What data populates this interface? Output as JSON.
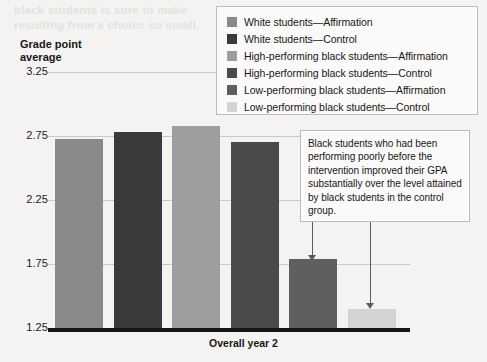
{
  "figure": {
    "background_color": "#f4f3f1",
    "ghost_text": [
      "black students is sure to make",
      "resulting from a choice so small."
    ]
  },
  "axis_title": "Grade point\naverage",
  "x_label": "Overall year 2",
  "legend": {
    "items": [
      {
        "label": "White students—Affirmation",
        "color": "#8a8a8c",
        "swatch_name": "legend-swatch-white-affirmation"
      },
      {
        "label": "White students—Control",
        "color": "#3a3a3d",
        "swatch_name": "legend-swatch-white-control"
      },
      {
        "label": "High-performing black students—Affirmation",
        "color": "#9d9d9f",
        "swatch_name": "legend-swatch-high-affirmation"
      },
      {
        "label": "High-performing black students—Control",
        "color": "#4a4a4d",
        "swatch_name": "legend-swatch-high-control"
      },
      {
        "label": "Low-performing black students—Affirmation",
        "color": "#5f5f62",
        "swatch_name": "legend-swatch-low-affirmation"
      },
      {
        "label": "Low-performing black students—Control",
        "color": "#d3d3d2",
        "swatch_name": "legend-swatch-low-control"
      }
    ]
  },
  "annotation": {
    "text": "Black students who had been performing poorly before the intervention improved their GPA substantially over the level attained by black students in the control group.",
    "arrow_targets": [
      "Low-performing black students—Affirmation",
      "Low-performing black students—Control"
    ]
  },
  "chart_data": {
    "type": "bar",
    "title": "",
    "xlabel": "Overall year 2",
    "ylabel": "Grade point average",
    "ylim": [
      1.25,
      3.25
    ],
    "yticks": [
      "3.25",
      "2.75",
      "2.25",
      "1.75",
      "1.25"
    ],
    "ytick_values": [
      3.25,
      2.75,
      2.25,
      1.75,
      1.25
    ],
    "grid": true,
    "legend_position": "top-right",
    "categories": [
      "Overall year 2"
    ],
    "series": [
      {
        "name": "White students—Affirmation",
        "values": [
          2.73
        ],
        "color": "#8a8a8c"
      },
      {
        "name": "White students—Control",
        "values": [
          2.78
        ],
        "color": "#3a3a3d"
      },
      {
        "name": "High-performing black students—Affirmation",
        "values": [
          2.83
        ],
        "color": "#9d9d9f"
      },
      {
        "name": "High-performing black students—Control",
        "values": [
          2.7
        ],
        "color": "#4a4a4d"
      },
      {
        "name": "Low-performing black students—Affirmation",
        "values": [
          1.79
        ],
        "color": "#5f5f62"
      },
      {
        "name": "Low-performing black students—Control",
        "values": [
          1.4
        ],
        "color": "#d3d3d2"
      }
    ]
  }
}
